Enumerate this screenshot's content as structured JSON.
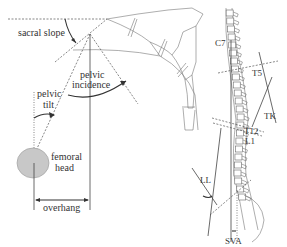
{
  "left_panel": {
    "labels": {
      "sacral_slope": "sacral slope",
      "pelvic_incidence_line1": "pelvic",
      "pelvic_incidence_line2": "incidence",
      "pelvic_tilt_line1": "pelvic",
      "pelvic_tilt_line2": "tilt",
      "femoral_head_line1": "femoral",
      "femoral_head_line2": "head",
      "overhang": "overhang"
    },
    "colors": {
      "femoral_head_fill": "#c8c8c8",
      "line": "#444444"
    }
  },
  "right_panel": {
    "labels": {
      "c7": "C7",
      "t5": "T5",
      "tk": "TK",
      "t12": "T12",
      "l1": "L1",
      "ll": "LL",
      "sva": "SVA"
    }
  }
}
